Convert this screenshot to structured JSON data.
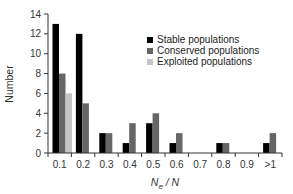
{
  "chart_data": {
    "type": "bar",
    "title": "",
    "xlabel_main": "N",
    "xlabel_sub": "e",
    "xlabel_rest": " / N",
    "xlabel": "Ne / N",
    "ylabel": "Number",
    "ylim": [
      0,
      14
    ],
    "yticks": [
      0,
      2,
      4,
      6,
      8,
      10,
      12,
      14
    ],
    "grid": false,
    "legend_position": "upper right",
    "categories": [
      "0.1",
      "0.2",
      "0.3",
      "0.4",
      "0.5",
      "0.6",
      "0.7",
      "0.8",
      "0.9",
      ">1"
    ],
    "series": [
      {
        "name": "Stable populations",
        "color": "#000000",
        "values": [
          13,
          12,
          2,
          1,
          3,
          1,
          0,
          1,
          0,
          1
        ]
      },
      {
        "name": "Conserved populations",
        "color": "#666666",
        "values": [
          8,
          5,
          2,
          3,
          4,
          2,
          0,
          1,
          0,
          2
        ]
      },
      {
        "name": "Exploited populations",
        "color": "#c4c4c4",
        "values": [
          6,
          0,
          0,
          0,
          0,
          0,
          0,
          0,
          0,
          0
        ]
      }
    ]
  }
}
